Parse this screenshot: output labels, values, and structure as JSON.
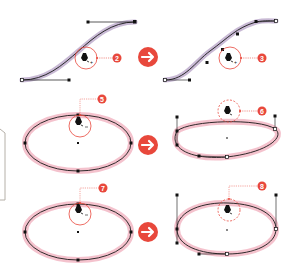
{
  "diagram": {
    "colors": {
      "accent": "#e8483c",
      "path_stroke": "#1a1a1a",
      "s_curve_highlight": "#9b7fb0",
      "ellipse_highlight": "#ec9aac",
      "handle": "#111111",
      "callout_line": "#e8483c",
      "frame": "#b5b0a8"
    },
    "steps": [
      {
        "id": "step-2",
        "badge": "2",
        "shape": "s-curve",
        "state": "before",
        "tool": "pen-plus"
      },
      {
        "id": "step-3",
        "badge": "3",
        "shape": "s-curve",
        "state": "after",
        "tool": "pen-plus"
      },
      {
        "id": "step-5",
        "badge": "5",
        "shape": "ellipse",
        "state": "before",
        "tool": "pen-minus"
      },
      {
        "id": "step-6",
        "badge": "6",
        "shape": "ellipse",
        "state": "after",
        "tool": "pen"
      },
      {
        "id": "step-7",
        "badge": "7",
        "shape": "ellipse",
        "state": "before",
        "tool": "pen-minus"
      },
      {
        "id": "step-8",
        "badge": "8",
        "shape": "ellipse",
        "state": "after",
        "tool": "pen"
      }
    ],
    "arrows": [
      {
        "id": "arrow-row-1",
        "glyph": "→"
      },
      {
        "id": "arrow-row-2",
        "glyph": "→"
      },
      {
        "id": "arrow-row-3",
        "glyph": "→"
      }
    ]
  }
}
